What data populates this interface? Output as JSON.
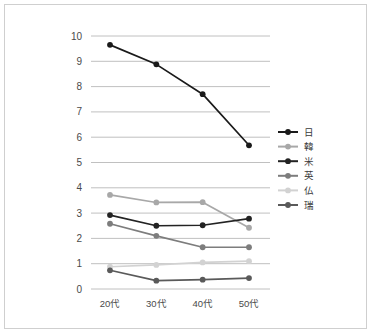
{
  "chart_data": {
    "type": "line",
    "title": "",
    "subtitle": "",
    "xlabel": "",
    "ylabel": "",
    "categories": [
      "20代",
      "30代",
      "40代",
      "50代"
    ],
    "ylim": [
      0,
      10
    ],
    "ytick_labels": [
      "10",
      "9",
      "8",
      "7",
      "6",
      "5",
      "4",
      "3",
      "2",
      "1",
      "0"
    ],
    "ytick_values": [
      10,
      9,
      8,
      7,
      6,
      5,
      4,
      3,
      2,
      1,
      0
    ],
    "grid": true,
    "grid_axis": "y",
    "legend_position": "right",
    "series": [
      {
        "name": "日",
        "color": "#1a1a1a",
        "marker": "circle",
        "values": [
          9.65,
          8.88,
          7.7,
          5.68
        ]
      },
      {
        "name": "韓",
        "color": "#a8a8a8",
        "marker": "circle",
        "values": [
          3.72,
          3.42,
          3.43,
          2.42
        ]
      },
      {
        "name": "米",
        "color": "#232323",
        "marker": "circle",
        "values": [
          2.92,
          2.5,
          2.52,
          2.78
        ]
      },
      {
        "name": "英",
        "color": "#7d7d7d",
        "marker": "circle",
        "values": [
          2.58,
          2.1,
          1.65,
          1.65
        ]
      },
      {
        "name": "仏",
        "color": "#d2d2d2",
        "marker": "circle",
        "values": [
          0.88,
          0.95,
          1.05,
          1.1
        ]
      },
      {
        "name": "瑞",
        "color": "#5a5a5a",
        "marker": "circle",
        "values": [
          0.74,
          0.33,
          0.37,
          0.43
        ]
      }
    ]
  },
  "figure": {
    "border_color": "#cfcfcf",
    "background": "#ffffff",
    "gridline_color": "#b9b9b9",
    "axis_text_color": "#4a4a4a"
  }
}
